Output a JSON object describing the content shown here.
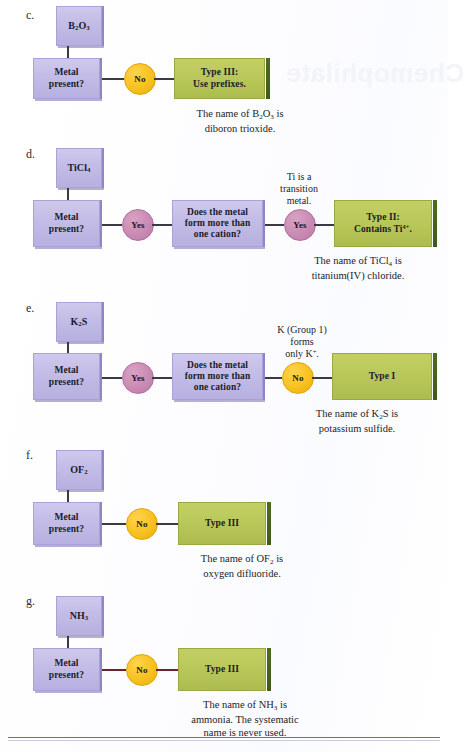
{
  "page": {
    "background_color": "#ffffff",
    "bleed_text_title": "Chemophilate",
    "rule_color": "#6f7180"
  },
  "palette": {
    "purple_box": "#c2bce6",
    "purple_edge": "#8f86c8",
    "green_box": "#b9c759",
    "green_rail": "#4d6b1f",
    "yellow_circle": "#f7c11f",
    "pink_circle": "#c98bb3",
    "connector": "#3a3a46",
    "connector_maroon": "#6a2230"
  },
  "common": {
    "metal_present_label": "Metal\npresent?",
    "metal_present_line1": "Metal",
    "metal_present_line2": "present?",
    "cation_q_line1": "Does the metal",
    "cation_q_line2": "form more than",
    "cation_q_line3": "one cation?",
    "yes_label": "Yes",
    "no_label": "No"
  },
  "sections": [
    {
      "id": "c",
      "label": "c.",
      "formula_html": "B<sub>2</sub>O<sub>3</sub>",
      "formula_plain": "B2O3",
      "decision_answer": "No",
      "decision_answer_color": "#f7c11f",
      "result_line1": "Type III:",
      "result_line2": "Use prefixes.",
      "caption_line1_html": "The name of B<sub>2</sub>O<sub>3</sub> is",
      "caption_line2": "diboron trioxide.",
      "has_second_question": false,
      "note": null
    },
    {
      "id": "d",
      "label": "d.",
      "formula_html": "TiCl<sub>4</sub>",
      "formula_plain": "TiCl4",
      "decision_answer": "Yes",
      "decision_answer_color": "#c98bb3",
      "second_answer": "Yes",
      "second_answer_color": "#c98bb3",
      "result_line1": "Type II:",
      "result_line2_html": "Contains Ti<sup>4+</sup>.",
      "caption_line1_html": "The name of TiCl<sub>4</sub> is",
      "caption_line2": "titanium(IV) chloride.",
      "has_second_question": true,
      "note_line1": "Ti is a",
      "note_line2": "transition",
      "note_line3": "metal."
    },
    {
      "id": "e",
      "label": "e.",
      "formula_html": "K<sub>2</sub>S",
      "formula_plain": "K2S",
      "decision_answer": "Yes",
      "decision_answer_color": "#c98bb3",
      "second_answer": "No",
      "second_answer_color": "#f7c11f",
      "result_line1": "Type I",
      "result_line2_html": "",
      "caption_line1_html": "The name of K<sub>2</sub>S is",
      "caption_line2": "potassium sulfide.",
      "has_second_question": true,
      "note_line1": "K (Group 1)",
      "note_line2": "forms",
      "note_line3_html": "only K<sup>+</sup>."
    },
    {
      "id": "f",
      "label": "f.",
      "formula_html": "OF<sub>2</sub>",
      "formula_plain": "OF2",
      "decision_answer": "No",
      "decision_answer_color": "#f7c11f",
      "result_line1": "Type III",
      "result_line2": "",
      "caption_line1_html": "The name of OF<sub>2</sub> is",
      "caption_line2": "oxygen difluoride.",
      "has_second_question": false,
      "note": null
    },
    {
      "id": "g",
      "label": "g.",
      "formula_html": "NH<sub>3</sub>",
      "formula_plain": "NH3",
      "decision_answer": "No",
      "decision_answer_color": "#f7c11f",
      "result_line1": "Type III",
      "result_line2": "",
      "caption_line1_html": "The name of NH<sub>3</sub> is",
      "caption_line2": "ammonia. The systematic",
      "caption_line3": "name is never used.",
      "has_second_question": false,
      "note": null
    }
  ]
}
